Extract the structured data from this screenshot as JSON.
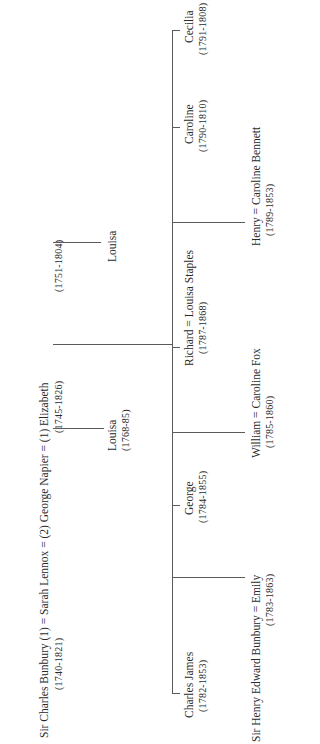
{
  "tree": {
    "parents": {
      "line": "Sir Charles Bunbury (1) = Sarah Lennox = (2) George Napier = (1) Elizabeth",
      "charles_dates": "(1740-1821)",
      "sarah_dates": "(1745-1826)",
      "napier_dates": "(1751-1804)"
    },
    "bunbury_child": {
      "name": "Louisa",
      "dates": "(1768-85)"
    },
    "napier_elizabeth_child": {
      "name": "Louisa"
    },
    "children": [
      {
        "name": "Charles James",
        "dates": "(1782-1853)"
      },
      {
        "name": "Sir Henry Edward Bunbury = Emily",
        "dates": "(1783-1863)"
      },
      {
        "name": "George",
        "dates": "(1784-1855)"
      },
      {
        "name": "William = Caroline Fox",
        "dates": "(1785-1860)"
      },
      {
        "name": "Richard = Louisa Staples",
        "dates": "(1787-1868)"
      },
      {
        "name": "Henry = Caroline Bennett",
        "dates": "(1789-1853)"
      },
      {
        "name": "Caroline",
        "dates": "(1790-1810)"
      },
      {
        "name": "Cecilia",
        "dates": "(1791-1808)"
      }
    ]
  }
}
